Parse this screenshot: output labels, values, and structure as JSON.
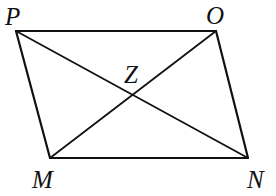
{
  "figure": {
    "type": "parallelogram-with-diagonals",
    "stroke_color": "#111111",
    "background": "#ffffff",
    "vertices": {
      "P": {
        "label": "P",
        "x": 16,
        "y": 31
      },
      "O": {
        "label": "O",
        "x": 216,
        "y": 31
      },
      "M": {
        "label": "M",
        "x": 50,
        "y": 158
      },
      "N": {
        "label": "N",
        "x": 248,
        "y": 158
      }
    },
    "intersection": {
      "label": "Z",
      "x": 133,
      "y": 95
    },
    "sides": [
      "PO",
      "ON",
      "NM",
      "MP"
    ],
    "diagonals": [
      "PN",
      "MO"
    ],
    "labels": {
      "P": "P",
      "O": "O",
      "Z": "Z",
      "M": "M",
      "N": "N"
    }
  }
}
